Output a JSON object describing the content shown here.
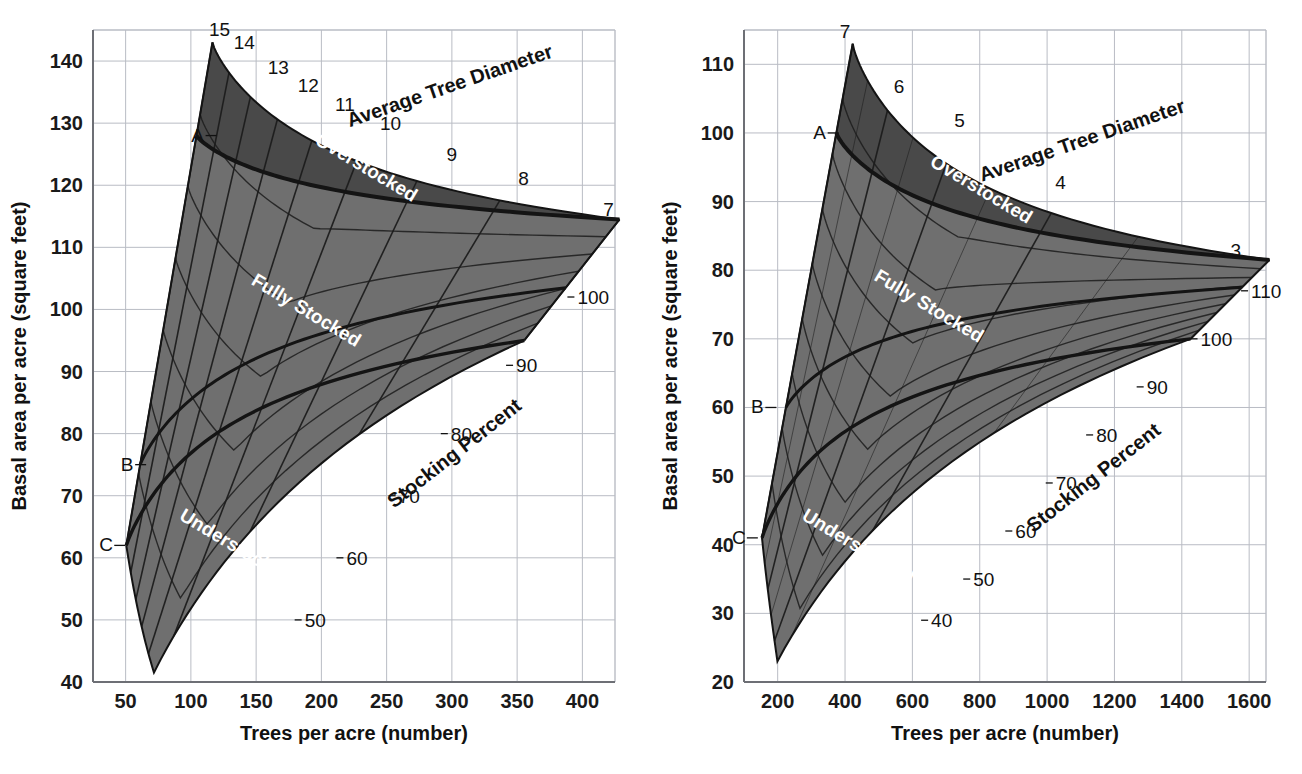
{
  "figure": {
    "background": "#ffffff",
    "panels": [
      "left",
      "right"
    ]
  },
  "colors": {
    "overstocked_fill": "#494949",
    "stocked_fill": "#6f6f6f",
    "grid": "#b9bcc4",
    "axis": "#6d6f75",
    "curve": "#1c1c1c",
    "boundary": "#141414",
    "text": "#111111",
    "region_text": "#ffffff"
  },
  "chart_data": [
    {
      "id": "left",
      "type": "line",
      "title": "",
      "xlabel": "Trees per acre (number)",
      "ylabel": "Basal area per acre (square feet)",
      "xlim": [
        25,
        425
      ],
      "ylim": [
        40,
        145
      ],
      "xticks": [
        50,
        100,
        150,
        200,
        250,
        300,
        350,
        400
      ],
      "yticks": [
        40,
        50,
        60,
        70,
        80,
        90,
        100,
        110,
        120,
        130,
        140
      ],
      "xtick_labels": [
        "50",
        "100",
        "150",
        "200",
        "250",
        "300",
        "350",
        "400"
      ],
      "ytick_labels": [
        "40",
        "50",
        "60",
        "70",
        "80",
        "90",
        "100",
        "110",
        "120",
        "130",
        "140"
      ],
      "grid": true,
      "legend": "none",
      "diameter_label": "Average Tree Diameter",
      "stocking_label": "Stocking Percent",
      "diameter_curves": [
        "15",
        "14",
        "13",
        "12",
        "11",
        "10",
        "9",
        "8",
        "7"
      ],
      "stocking_curves": [
        "100",
        "90",
        "80",
        "70",
        "60",
        "50"
      ],
      "region_labels": [
        "Overstocked",
        "Fully Stocked",
        "Understocked"
      ],
      "boundary_markers": [
        {
          "label": "A",
          "basal_area": 128,
          "trees": 122
        },
        {
          "label": "B",
          "basal_area": 75,
          "trees": 68
        },
        {
          "label": "C",
          "basal_area": 62,
          "trees": 52
        }
      ],
      "diameter_label_points": [
        {
          "label": "15",
          "x": 122,
          "y": 143
        },
        {
          "label": "14",
          "x": 141,
          "y": 141
        },
        {
          "label": "13",
          "x": 167,
          "y": 137
        },
        {
          "label": "12",
          "x": 190,
          "y": 134
        },
        {
          "label": "11",
          "x": 218,
          "y": 131
        },
        {
          "label": "10",
          "x": 253,
          "y": 128
        },
        {
          "label": "9",
          "x": 300,
          "y": 123
        },
        {
          "label": "8",
          "x": 355,
          "y": 119
        },
        {
          "label": "7",
          "x": 420,
          "y": 114
        }
      ],
      "stocking_label_points": [
        {
          "label": "100",
          "x": 387,
          "y": 102
        },
        {
          "label": "90",
          "x": 340,
          "y": 91
        },
        {
          "label": "80",
          "x": 290,
          "y": 80
        },
        {
          "label": "70",
          "x": 250,
          "y": 70
        },
        {
          "label": "60",
          "x": 210,
          "y": 60
        },
        {
          "label": "50",
          "x": 178,
          "y": 50
        }
      ]
    },
    {
      "id": "right",
      "type": "line",
      "title": "",
      "xlabel": "Trees per acre (number)",
      "ylabel": "Basal area per acre (square feet)",
      "xlim": [
        100,
        1650
      ],
      "ylim": [
        20,
        115
      ],
      "xticks": [
        200,
        400,
        600,
        800,
        1000,
        1200,
        1400,
        1600
      ],
      "yticks": [
        20,
        30,
        40,
        50,
        60,
        70,
        80,
        90,
        100,
        110
      ],
      "xtick_labels": [
        "200",
        "400",
        "600",
        "800",
        "1000",
        "1200",
        "1400",
        "1600"
      ],
      "ytick_labels": [
        "20",
        "30",
        "40",
        "50",
        "60",
        "70",
        "80",
        "90",
        "100",
        "110"
      ],
      "grid": true,
      "legend": "none",
      "diameter_label": "Average Tree Diameter",
      "stocking_label": "Stocking Percent",
      "diameter_curves": [
        "7",
        "6",
        "5",
        "4",
        "3"
      ],
      "stocking_curves": [
        "110",
        "100",
        "90",
        "80",
        "70",
        "60",
        "50",
        "40"
      ],
      "region_labels": [
        "Overstocked",
        "Fully Stocked",
        "Understocked"
      ],
      "boundary_markers": [
        {
          "label": "A",
          "basal_area": 100,
          "trees": 390
        },
        {
          "label": "B",
          "basal_area": 60,
          "trees": 205
        },
        {
          "label": "C",
          "basal_area": 41,
          "trees": 150
        }
      ],
      "diameter_label_points": [
        {
          "label": "7",
          "x": 400,
          "y": 113
        },
        {
          "label": "6",
          "x": 560,
          "y": 105
        },
        {
          "label": "5",
          "x": 740,
          "y": 100
        },
        {
          "label": "4",
          "x": 1040,
          "y": 91
        },
        {
          "label": "3",
          "x": 1560,
          "y": 81
        }
      ],
      "stocking_label_points": [
        {
          "label": "110",
          "x": 1570,
          "y": 77
        },
        {
          "label": "100",
          "x": 1420,
          "y": 70
        },
        {
          "label": "90",
          "x": 1260,
          "y": 63
        },
        {
          "label": "80",
          "x": 1110,
          "y": 56
        },
        {
          "label": "70",
          "x": 990,
          "y": 49
        },
        {
          "label": "60",
          "x": 870,
          "y": 42
        },
        {
          "label": "50",
          "x": 745,
          "y": 35
        },
        {
          "label": "40",
          "x": 620,
          "y": 29
        }
      ]
    }
  ]
}
